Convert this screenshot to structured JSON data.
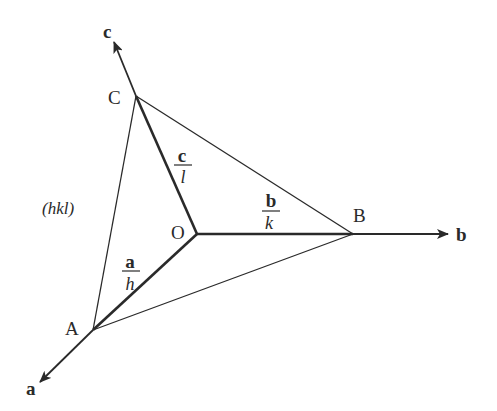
{
  "diagram": {
    "axes": [
      {
        "id": "a",
        "label": "a"
      },
      {
        "id": "b",
        "label": "b"
      },
      {
        "id": "c",
        "label": "c"
      }
    ],
    "points": {
      "origin": "O",
      "A": "A",
      "B": "B",
      "C": "C"
    },
    "plane_label": "(hkl)",
    "intercepts": {
      "a": {
        "numerator": "a",
        "denominator": "h"
      },
      "b": {
        "numerator": "b",
        "denominator": "k"
      },
      "c": {
        "numerator": "c",
        "denominator": "l"
      }
    },
    "colors": {
      "line": "#2a2a2a",
      "background": "#ffffff"
    }
  }
}
